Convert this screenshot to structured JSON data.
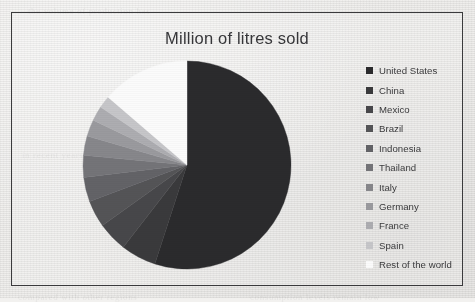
{
  "chart_data": {
    "type": "pie",
    "title": "Million of litres sold",
    "legend_position": "right",
    "grid": false,
    "categories": [
      "United States",
      "China",
      "Mexico",
      "Brazil",
      "Indonesia",
      "Thailand",
      "Italy",
      "Germany",
      "France",
      "Spain",
      "Rest of the world"
    ],
    "values": [
      55.0,
      5.5,
      4.6,
      4.2,
      3.8,
      3.4,
      3.0,
      2.6,
      2.3,
      1.9,
      13.7
    ],
    "slice_colors": [
      "#2b2b2d",
      "#3a3a3c",
      "#47474a",
      "#545457",
      "#636367",
      "#747478",
      "#87878b",
      "#9a9a9e",
      "#adadb1",
      "#c6c6c9",
      "#fbfbfb"
    ],
    "legend_entries": [
      {
        "label": "United States",
        "color": "#2b2b2d",
        "value": 55.0
      },
      {
        "label": "China",
        "color": "#3a3a3c",
        "value": 5.5
      },
      {
        "label": "Mexico",
        "color": "#47474a",
        "value": 4.6
      },
      {
        "label": "Brazil",
        "color": "#545457",
        "value": 4.2
      },
      {
        "label": "Indonesia",
        "color": "#636367",
        "value": 3.8
      },
      {
        "label": "Thailand",
        "color": "#747478",
        "value": 3.4
      },
      {
        "label": "Italy",
        "color": "#87878b",
        "value": 3.0
      },
      {
        "label": "Germany",
        "color": "#9a9a9e",
        "value": 2.6
      },
      {
        "label": "France",
        "color": "#adadb1",
        "value": 2.3
      },
      {
        "label": "Spain",
        "color": "#c6c6c9",
        "value": 1.9
      },
      {
        "label": "Rest of the world",
        "color": "#fbfbfb",
        "value": 13.7
      }
    ],
    "xlabel": "",
    "ylabel": ""
  },
  "figure": {
    "title": "Million of litres sold",
    "border_color": "#3b3b3d",
    "background_color": "#eeedeb"
  },
  "ghost_text": {
    "line1": "the  volume  of  production  has",
    "line2": "in  recent  years  the  market  for",
    "line3": "consumption  levels  remain  low",
    "line4": "compared  with  other  regions"
  }
}
